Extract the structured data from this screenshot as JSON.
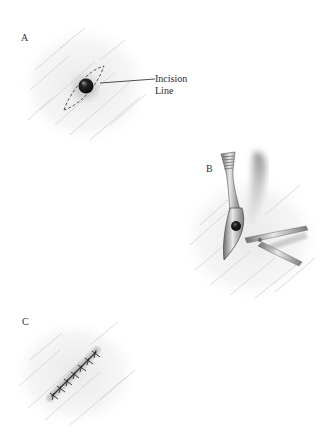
{
  "figure": {
    "panels": [
      {
        "id": "A",
        "label": "A",
        "description": "Skin lesion with dashed elliptical incision outline",
        "callout": {
          "line1": "Incision",
          "line2": "Line"
        }
      },
      {
        "id": "B",
        "label": "B",
        "description": "Forceps lifting excised ellipse while scissors undermine"
      },
      {
        "id": "C",
        "label": "C",
        "description": "Closed incision with interrupted sutures"
      }
    ],
    "colors": {
      "background": "#ffffff",
      "skin_hatch": "#c9c9c9",
      "lesion": "#1a1a1a",
      "instrument": "#8a8a8a",
      "instrument_shadow": "#9a9a9a",
      "suture": "#3a3a3a",
      "text": "#333333"
    }
  }
}
